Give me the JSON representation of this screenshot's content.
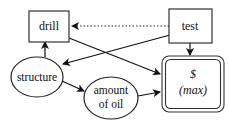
{
  "diagram": {
    "type": "influence-diagram",
    "nodes": {
      "drill": {
        "label": "drill",
        "shape": "decision-rectangle"
      },
      "test": {
        "label": "test",
        "shape": "decision-rectangle"
      },
      "structure": {
        "label": "structure",
        "shape": "chance-ellipse"
      },
      "amount_of_oil": {
        "line1": "amount",
        "line2": "of oil",
        "shape": "chance-ellipse"
      },
      "value": {
        "line1": "$",
        "line2": "(max)",
        "shape": "value-double-rounded-rectangle"
      }
    },
    "edges": [
      {
        "from": "test",
        "to": "drill",
        "style": "dotted"
      },
      {
        "from": "test",
        "to": "structure",
        "style": "solid"
      },
      {
        "from": "test",
        "to": "value",
        "style": "solid"
      },
      {
        "from": "drill",
        "to": "value",
        "style": "solid"
      },
      {
        "from": "structure",
        "to": "drill",
        "style": "solid"
      },
      {
        "from": "structure",
        "to": "amount_of_oil",
        "style": "solid"
      },
      {
        "from": "amount_of_oil",
        "to": "value",
        "style": "solid"
      }
    ]
  }
}
